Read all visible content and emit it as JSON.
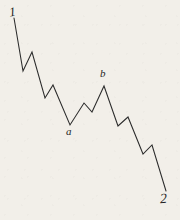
{
  "figure": {
    "background_color": "#f2efe9",
    "stroke_color": "#2b2b2b",
    "width": 180,
    "height": 220
  },
  "labels": {
    "start": "1",
    "wave_a": "a",
    "wave_b": "b",
    "end": "2"
  },
  "chart_data": {
    "type": "line",
    "title": "",
    "xlabel": "",
    "ylabel": "",
    "grid": false,
    "legend": "none",
    "xlim": [
      0,
      180
    ],
    "ylim": [
      220,
      0
    ],
    "annotations": [
      {
        "text": "1",
        "x": 14,
        "y": 18,
        "position": "above-left"
      },
      {
        "text": "a",
        "x": 70,
        "y": 125,
        "position": "below"
      },
      {
        "text": "b",
        "x": 104,
        "y": 86,
        "position": "above"
      },
      {
        "text": "2",
        "x": 166,
        "y": 191,
        "position": "below-right"
      }
    ],
    "series": [
      {
        "name": "zigzag",
        "points": [
          [
            14,
            18
          ],
          [
            23,
            71
          ],
          [
            32,
            52
          ],
          [
            45,
            98
          ],
          [
            53,
            85
          ],
          [
            70,
            125
          ],
          [
            84,
            103
          ],
          [
            92,
            112
          ],
          [
            104,
            86
          ],
          [
            118,
            126
          ],
          [
            128,
            117
          ],
          [
            143,
            154
          ],
          [
            152,
            145
          ],
          [
            166,
            191
          ]
        ]
      }
    ],
    "path_d": "M14,18 L23,71 L32,52 L45,98 L53,85 L70,125 L84,103 L92,112 L104,86 L118,126 L128,117 L143,154 L152,145 L166,191"
  }
}
